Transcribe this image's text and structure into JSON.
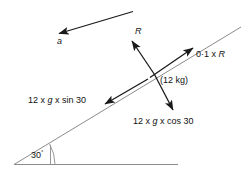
{
  "figure": {
    "colors": {
      "incline_line": "#8c8c8c",
      "ground_line": "#8c8c8c",
      "force_arrow": "#1a1a1a",
      "text": "#111111",
      "background": "#ffffff"
    },
    "labels": {
      "acceleration": "a",
      "normal_reaction": "R",
      "friction": "0·1 x R",
      "mass": "(12 kg)",
      "weight_component_along": "12 x g x sin 30",
      "weight_component_perp": "12 x g x cos 30",
      "angle": "30",
      "angle_degree_symbol": "°"
    },
    "icons": {
      "acceleration_arrow": "arrow-down-left-icon",
      "normal_arrow": "arrow-up-left-icon",
      "friction_arrow": "arrow-up-right-icon",
      "weight_arrow": "arrow-down-right-icon",
      "sin_component_arrow": "arrow-down-left-icon",
      "angle_arc": "arc-icon"
    }
  },
  "chart_data": {
    "type": "diagram",
    "incline_angle_deg": 30,
    "mass_kg": 12,
    "friction_coefficient": 0.1,
    "forces": [
      {
        "name": "R",
        "label": "R",
        "description": "normal reaction, perpendicular to incline, pointing away from surface"
      },
      {
        "name": "friction",
        "label": "0·1 x R",
        "description": "friction force up the incline"
      },
      {
        "name": "weight_along_incline",
        "label": "12 x g x sin 30",
        "description": "weight component down the incline"
      },
      {
        "name": "weight_perpendicular",
        "label": "12 x g x cos 30",
        "description": "weight component perpendicular into the incline"
      },
      {
        "name": "acceleration",
        "label": "a",
        "description": "acceleration directed down the incline"
      }
    ]
  }
}
